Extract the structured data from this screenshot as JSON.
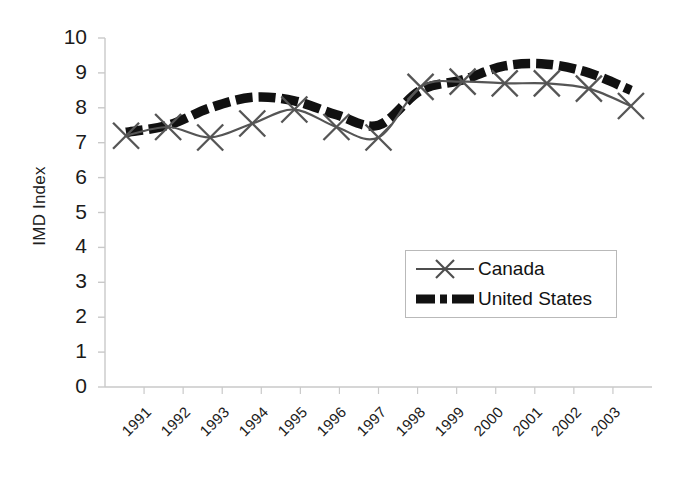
{
  "chart_data": {
    "type": "line",
    "title": "",
    "xlabel": "",
    "ylabel": "IMD Index",
    "ylim": [
      0,
      10
    ],
    "ytick_step": 1,
    "grid": false,
    "legend_position": "center-right",
    "categories": [
      "1991",
      "1992",
      "1993",
      "1994",
      "1995",
      "1996",
      "1997",
      "1998",
      "1999",
      "2000",
      "2001",
      "2002",
      "2003"
    ],
    "yticks": [
      "0",
      "1",
      "2",
      "3",
      "4",
      "5",
      "6",
      "7",
      "8",
      "9",
      "10"
    ],
    "series": [
      {
        "name": "Canada",
        "color": "#555555",
        "style": "solid-thin-with-x-markers",
        "marker": "x",
        "values": [
          7.2,
          7.45,
          7.15,
          7.55,
          7.95,
          7.45,
          7.15,
          8.6,
          8.75,
          8.7,
          8.7,
          8.55,
          8.05
        ]
      },
      {
        "name": "United States",
        "color": "#111111",
        "style": "thick-dashed",
        "marker": "none",
        "values": [
          7.3,
          7.5,
          8.0,
          8.3,
          8.2,
          7.8,
          7.5,
          8.5,
          8.8,
          9.2,
          9.25,
          9.0,
          8.5
        ]
      }
    ]
  },
  "legend": {
    "items": [
      {
        "label": "Canada"
      },
      {
        "label": "United States"
      }
    ]
  },
  "axis": {
    "y_title": "IMD Index"
  }
}
